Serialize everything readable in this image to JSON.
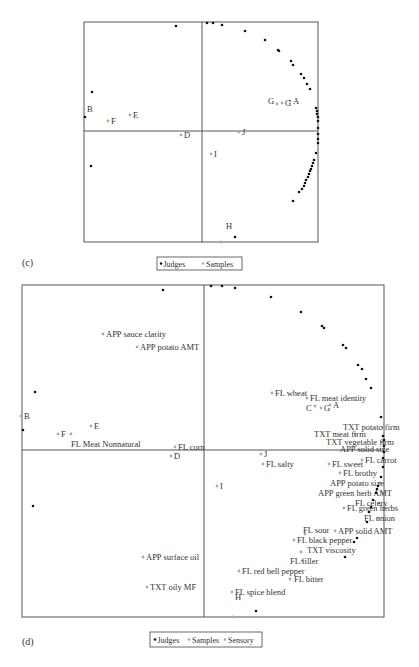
{
  "chart_data": [
    {
      "panel": "(c)",
      "type": "scatter",
      "title": "",
      "xlabel": "",
      "ylabel": "",
      "grid": false,
      "frame_px": {
        "left": 84,
        "right": 318,
        "top": 22,
        "bottom": 242,
        "axis_x": 202,
        "axis_y": 131
      },
      "legend": {
        "position": "bottom-center",
        "entries": [
          "Judges",
          "Samples"
        ]
      },
      "series": [
        {
          "name": "Samples",
          "color": "#aaaaaa",
          "points": [
            {
              "label": "A",
              "px": [
                290,
                101
              ]
            },
            {
              "label": "G",
              "px": [
                277,
                104
              ],
              "label_dx": -9,
              "label_dy": -3
            },
            {
              "label": "G",
              "px": [
                282,
                103
              ]
            },
            {
              "label": "B",
              "px": [
                84,
                109
              ]
            },
            {
              "label": "E",
              "px": [
                130,
                115
              ]
            },
            {
              "label": "F",
              "px": [
                108,
                121
              ]
            },
            {
              "label": "D",
              "px": [
                181,
                135
              ]
            },
            {
              "label": "J",
              "px": [
                239,
                132
              ]
            },
            {
              "label": "I",
              "px": [
                211,
                154
              ]
            },
            {
              "label": "H",
              "px": [
                221,
                242
              ],
              "label_dx": 5,
              "label_dy": -16
            }
          ]
        },
        {
          "name": "Judges",
          "color": "#111111",
          "points_px": [
            [
              176,
              26
            ],
            [
              207,
              23
            ],
            [
              213,
              23
            ],
            [
              222,
              25
            ],
            [
              245,
              31
            ],
            [
              265,
              40
            ],
            [
              278,
              50
            ],
            [
              279,
              51
            ],
            [
              291,
              61
            ],
            [
              293,
              65
            ],
            [
              301,
              74
            ],
            [
              304,
              78
            ],
            [
              307,
              84
            ],
            [
              310,
              89
            ],
            [
              316,
              108
            ],
            [
              317,
              111
            ],
            [
              317,
              114
            ],
            [
              318,
              117
            ],
            [
              318,
              121
            ],
            [
              318,
              128
            ],
            [
              318,
              134
            ],
            [
              318,
              139
            ],
            [
              318,
              143
            ],
            [
              316,
              153
            ],
            [
              314,
              160
            ],
            [
              313,
              163
            ],
            [
              312,
              166
            ],
            [
              311,
              169
            ],
            [
              310,
              171
            ],
            [
              309,
              174
            ],
            [
              308,
              177
            ],
            [
              306,
              180
            ],
            [
              305,
              183
            ],
            [
              304,
              186
            ],
            [
              302,
              189
            ],
            [
              299,
              192
            ],
            [
              293,
              201
            ],
            [
              92,
              92
            ],
            [
              85,
              117
            ],
            [
              91,
              166
            ],
            [
              235,
              237
            ]
          ]
        }
      ]
    },
    {
      "panel": "(d)",
      "type": "scatter",
      "title": "",
      "xlabel": "",
      "ylabel": "",
      "grid": false,
      "frame_px": {
        "left": 22,
        "right": 384,
        "top": 285,
        "bottom": 617,
        "axis_x": 204,
        "axis_y": 450
      },
      "legend": {
        "position": "bottom-center",
        "entries": [
          "Judges",
          "Samples",
          "Sensory"
        ]
      },
      "series": [
        {
          "name": "Samples",
          "color": "#aaaaaa",
          "points": [
            {
              "label": "B",
              "px": [
                21,
                416
              ]
            },
            {
              "label": "E",
              "px": [
                91,
                426
              ]
            },
            {
              "label": "F",
              "px": [
                58,
                434
              ]
            },
            {
              "label": "D",
              "px": [
                171,
                456
              ]
            },
            {
              "label": "C",
              "px": [
                315,
                406
              ],
              "label_dx": -9,
              "label_dy": 2
            },
            {
              "label": "G",
              "px": [
                321,
                408
              ]
            },
            {
              "label": "A",
              "px": [
                330,
                405
              ]
            },
            {
              "label": "J",
              "px": [
                261,
                454
              ]
            },
            {
              "label": "I",
              "px": [
                217,
                486
              ]
            },
            {
              "label": "H",
              "px": [
                233,
                617
              ],
              "label_dx": 2,
              "label_dy": -20
            }
          ]
        },
        {
          "name": "Sensory",
          "color": "#aaaaaa",
          "points": [
            {
              "label": "APP sauce clarity",
              "px": [
                103,
                334
              ]
            },
            {
              "label": "APP potato AMT",
              "px": [
                137,
                347
              ]
            },
            {
              "label": "FL Meat Nonnatural",
              "px": [
                71,
                434
              ],
              "label_dx": 0,
              "label_dy": 10
            },
            {
              "label": "FL corn",
              "px": [
                175,
                447
              ]
            },
            {
              "label": "FL wheat",
              "px": [
                272,
                393
              ]
            },
            {
              "label": "FL meat identity",
              "px": [
                307,
                398
              ]
            },
            {
              "label": "TXT potato firm",
              "px": [
                383,
                427
              ],
              "label_dx": -40,
              "label_dy": 0
            },
            {
              "label": "TXT meat firm",
              "px": [
                355,
                434
              ],
              "label_dx": -41,
              "label_dy": 0
            },
            {
              "label": "TXT vegetable firm",
              "px": [
                382,
                442
              ],
              "label_dx": -56,
              "label_dy": 0
            },
            {
              "label": "APP solid size",
              "px": [
                383,
                449
              ],
              "label_dx": -43,
              "label_dy": 0
            },
            {
              "label": "FL salty",
              "px": [
                263,
                464
              ]
            },
            {
              "label": "FL sweet",
              "px": [
                329,
                464
              ]
            },
            {
              "label": "FL carrot",
              "px": [
                362,
                460
              ]
            },
            {
              "label": "FL brothy",
              "px": [
                340,
                473
              ]
            },
            {
              "label": "APP potato size",
              "px": [
                380,
                483
              ],
              "label_dx": -50,
              "label_dy": 0
            },
            {
              "label": "APP green herb AMT",
              "px": [
                383,
                493
              ],
              "label_dx": -65,
              "label_dy": 0
            },
            {
              "label": "FL celery",
              "px": [
                379,
                503
              ],
              "label_dx": -24,
              "label_dy": 0
            },
            {
              "label": "FL green herbs",
              "px": [
                344,
                508
              ]
            },
            {
              "label": "FL onion",
              "px": [
                378,
                518
              ],
              "label_dx": -14,
              "label_dy": 0
            },
            {
              "label": "APP solid AMT",
              "px": [
                335,
                531
              ]
            },
            {
              "label": "FL sour",
              "px": [
                305,
                534
              ],
              "label_dx": -2,
              "label_dy": -4
            },
            {
              "label": "FL black pepper",
              "px": [
                294,
                540
              ]
            },
            {
              "label": "TXT viscosity",
              "px": [
                301,
                552
              ],
              "label_dx": 6,
              "label_dy": -2
            },
            {
              "label": "FL filler",
              "px": [
                302,
                561
              ],
              "label_dx": -12,
              "label_dy": 0
            },
            {
              "label": "FL red bell pepper",
              "px": [
                239,
                571
              ]
            },
            {
              "label": "FL bitter",
              "px": [
                290,
                579
              ],
              "label_dx": 4,
              "label_dy": 0
            },
            {
              "label": "APP surface oil",
              "px": [
                143,
                557
              ]
            },
            {
              "label": "TXT oily MF",
              "px": [
                147,
                587
              ]
            },
            {
              "label": "FL spice blend",
              "px": [
                232,
                592
              ]
            }
          ]
        },
        {
          "name": "Judges",
          "color": "#111111",
          "points_px": [
            [
              163,
              290
            ],
            [
              211,
              286
            ],
            [
              222,
              286
            ],
            [
              235,
              288
            ],
            [
              271,
              297
            ],
            [
              301,
              312
            ],
            [
              322,
              326
            ],
            [
              324,
              328
            ],
            [
              343,
              345
            ],
            [
              346,
              348
            ],
            [
              358,
              365
            ],
            [
              362,
              369
            ],
            [
              366,
              379
            ],
            [
              371,
              388
            ],
            [
              381,
              417
            ],
            [
              383,
              436
            ],
            [
              384,
              440
            ],
            [
              384,
              446
            ],
            [
              384,
              452
            ],
            [
              383,
              458
            ],
            [
              383,
              467
            ],
            [
              381,
              477
            ],
            [
              378,
              486
            ],
            [
              377,
              489
            ],
            [
              376,
              493
            ],
            [
              373,
              500
            ],
            [
              371,
              507
            ],
            [
              369,
              512
            ],
            [
              367,
              522
            ],
            [
              357,
              538
            ],
            [
              354,
              542
            ],
            [
              345,
              557
            ],
            [
              35,
              392
            ],
            [
              23,
              430
            ],
            [
              33,
              506
            ],
            [
              256,
              611
            ]
          ]
        }
      ]
    }
  ],
  "panels": {
    "c": {
      "label": "(c)",
      "legend": {
        "judges": "Judges",
        "samples": "Samples"
      }
    },
    "d": {
      "label": "(d)",
      "legend": {
        "judges": "Judges",
        "samples": "Samples",
        "sensory": "Sensory"
      }
    }
  }
}
